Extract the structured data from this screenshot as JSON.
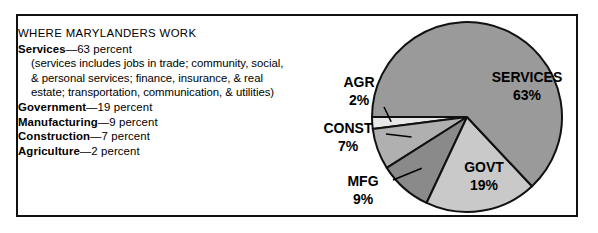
{
  "figure": {
    "heading": "WHERE MARYLANDERS WORK",
    "note_lines": [
      "(services includes jobs in trade; community, social,",
      "& personal services; finance, insurance, & real",
      "estate; transportation, communication, & utilities)"
    ],
    "entries": [
      {
        "name": "Services",
        "dash": "—63 percent"
      },
      {
        "name": "Government",
        "dash": "—19 percent"
      },
      {
        "name": "Manufacturing",
        "dash": "—9 percent"
      },
      {
        "name": "Construction",
        "dash": "—7 percent"
      },
      {
        "name": "Agriculture",
        "dash": "—2 percent"
      }
    ]
  },
  "chart_data": {
    "type": "pie",
    "title": "WHERE MARYLANDERS WORK",
    "categories": [
      "SERVICES",
      "GOVT",
      "MFG",
      "CONST",
      "AGR"
    ],
    "values": [
      63,
      19,
      9,
      7,
      2
    ],
    "value_labels": [
      "63%",
      "19%",
      "9%",
      "7%",
      "2%"
    ],
    "units": "percent",
    "colors": [
      "#9a9a9a",
      "#c9c9c9",
      "#8a8a8a",
      "#b0b0b0",
      "#e8e8e8"
    ],
    "stroke": "#111111",
    "legend": "none",
    "labels_inside": [
      "SERVICES",
      "GOVT"
    ],
    "labels_outside": [
      "AGR",
      "CONST",
      "MFG"
    ],
    "slices": [
      {
        "label": "SERVICES",
        "value": 63,
        "value_label": "63%",
        "color": "#9a9a9a",
        "label_placement": "inside"
      },
      {
        "label": "GOVT",
        "value": 19,
        "value_label": "19%",
        "color": "#c9c9c9",
        "label_placement": "inside"
      },
      {
        "label": "MFG",
        "value": 9,
        "value_label": "9%",
        "color": "#8a8a8a",
        "label_placement": "outside-left"
      },
      {
        "label": "CONST",
        "value": 7,
        "value_label": "7%",
        "color": "#b0b0b0",
        "label_placement": "outside-left"
      },
      {
        "label": "AGR",
        "value": 2,
        "value_label": "2%",
        "color": "#e8e8e8",
        "label_placement": "outside-left"
      }
    ]
  }
}
